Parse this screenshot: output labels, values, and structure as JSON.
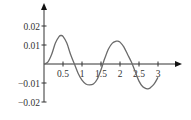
{
  "chart_data": {
    "type": "line",
    "title": "",
    "xlabel": "",
    "ylabel": "",
    "xlim": [
      0,
      3.3
    ],
    "ylim": [
      -0.02,
      0.025
    ],
    "x_ticks": [
      "0.5",
      "1",
      "1.5",
      "2",
      "2.5",
      "3"
    ],
    "y_ticks": [
      "0.02",
      "0.01",
      "-0.01",
      "-0.02"
    ],
    "grid": false,
    "legend": null,
    "series": [
      {
        "name": "curve",
        "color": "#6b6b6b",
        "x": [
          0,
          0.1,
          0.2,
          0.3,
          0.4,
          0.45,
          0.5,
          0.6,
          0.7,
          0.8,
          0.9,
          1.0,
          1.1,
          1.2,
          1.3,
          1.4,
          1.5,
          1.55,
          1.6,
          1.7,
          1.8,
          1.9,
          1.95,
          2.0,
          2.1,
          2.2,
          2.3,
          2.4,
          2.5,
          2.6,
          2.7,
          2.75,
          2.8,
          2.9,
          3.0
        ],
        "y": [
          0,
          0.001,
          0.005,
          0.011,
          0.0145,
          0.015,
          0.0145,
          0.011,
          0.005,
          0.0,
          -0.005,
          -0.0085,
          -0.0105,
          -0.011,
          -0.0105,
          -0.008,
          -0.003,
          0.0,
          0.003,
          0.008,
          0.011,
          0.012,
          0.012,
          0.0115,
          0.009,
          0.005,
          0.001,
          -0.004,
          -0.009,
          -0.012,
          -0.013,
          -0.013,
          -0.0125,
          -0.0105,
          -0.007
        ]
      }
    ]
  }
}
